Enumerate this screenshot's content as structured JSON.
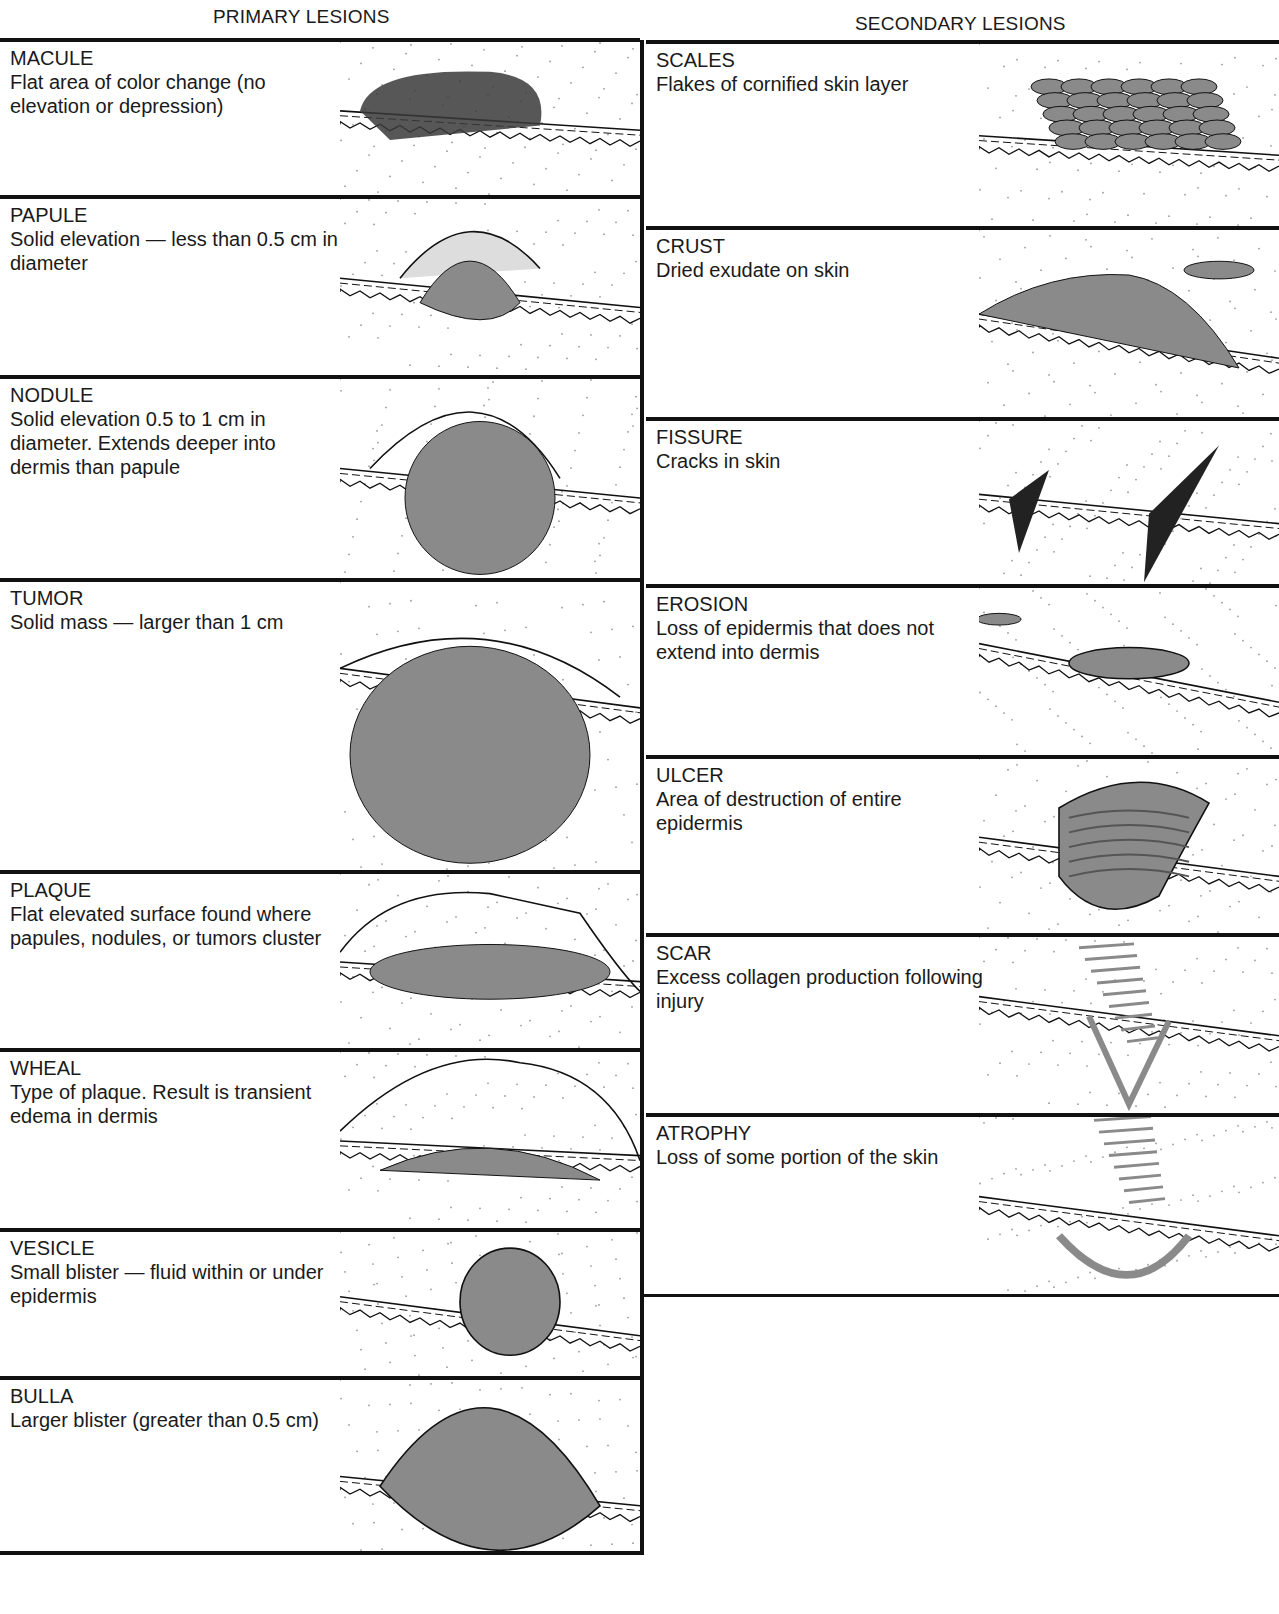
{
  "primary": {
    "title": "PRIMARY LESIONS",
    "items": [
      {
        "name": "MACULE",
        "desc": "Flat area of color change (no elevation or depression)",
        "illustration": "macule-illustration"
      },
      {
        "name": "PAPULE",
        "desc": "Solid elevation — less than 0.5 cm in diameter",
        "illustration": "papule-illustration"
      },
      {
        "name": "NODULE",
        "desc": "Solid elevation 0.5 to 1 cm in diameter. Extends deeper into dermis than papule",
        "illustration": "nodule-illustration"
      },
      {
        "name": "TUMOR",
        "desc": "Solid mass — larger than 1 cm",
        "illustration": "tumor-illustration"
      },
      {
        "name": "PLAQUE",
        "desc": "Flat elevated surface found where papules, nodules, or tumors cluster",
        "illustration": "plaque-illustration"
      },
      {
        "name": "WHEAL",
        "desc": "Type of plaque. Result is transient edema in dermis",
        "illustration": "wheal-illustration"
      },
      {
        "name": "VESICLE",
        "desc": "Small blister — fluid within or under epidermis",
        "illustration": "vesicle-illustration"
      },
      {
        "name": "BULLA",
        "desc": "Larger blister (greater than 0.5 cm)",
        "illustration": "bulla-illustration"
      }
    ]
  },
  "secondary": {
    "title": "SECONDARY LESIONS",
    "items": [
      {
        "name": "SCALES",
        "desc": "Flakes of cornified skin layer",
        "illustration": "scales-illustration"
      },
      {
        "name": "CRUST",
        "desc": "Dried exudate on skin",
        "illustration": "crust-illustration"
      },
      {
        "name": "FISSURE",
        "desc": "Cracks in skin",
        "illustration": "fissure-illustration"
      },
      {
        "name": "EROSION",
        "desc": "Loss of epidermis that does not extend into dermis",
        "illustration": "erosion-illustration"
      },
      {
        "name": "ULCER",
        "desc": "Area of destruction of entire epidermis",
        "illustration": "ulcer-illustration"
      },
      {
        "name": "SCAR",
        "desc": "Excess collagen production following injury",
        "illustration": "scar-illustration"
      },
      {
        "name": "ATROPHY",
        "desc": "Loss of some portion of the skin",
        "illustration": "atrophy-illustration"
      }
    ]
  },
  "colors": {
    "ink": "#111111",
    "lesion_fill": "#8a8a8a",
    "lesion_dark": "#555555",
    "skin_stipple": "#9a9a9a"
  }
}
